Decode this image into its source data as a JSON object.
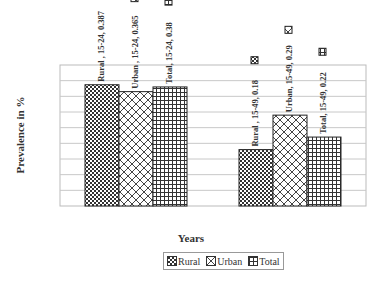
{
  "chart_data": {
    "type": "bar",
    "title": "",
    "xlabel": "Years",
    "ylabel": "Prevalence in  %",
    "categories": [
      "15-24",
      "15-49"
    ],
    "series": [
      {
        "name": "Rural",
        "values": [
          0.387,
          0.18
        ],
        "pattern": "checker"
      },
      {
        "name": "Urban",
        "values": [
          0.365,
          0.29
        ],
        "pattern": "diagonal-cross"
      },
      {
        "name": "Total",
        "values": [
          0.38,
          0.22
        ],
        "pattern": "grid"
      }
    ],
    "data_labels": [
      [
        "Rural , 15-24, 0.387",
        "Rural , 15-49, 0.18"
      ],
      [
        "Urban , 15-24, 0.365",
        "Urban, 15-49, 0.29"
      ],
      [
        "Total, 15-24, 0.38",
        "Total, 15-49, 0.22"
      ]
    ],
    "ylim": [
      0,
      0.45
    ],
    "grid": true,
    "y_tick_labels_visible": false,
    "legend_position": "bottom"
  },
  "legend": {
    "items": [
      {
        "label": "Rural"
      },
      {
        "label": "Urban"
      },
      {
        "label": "Total"
      }
    ]
  }
}
